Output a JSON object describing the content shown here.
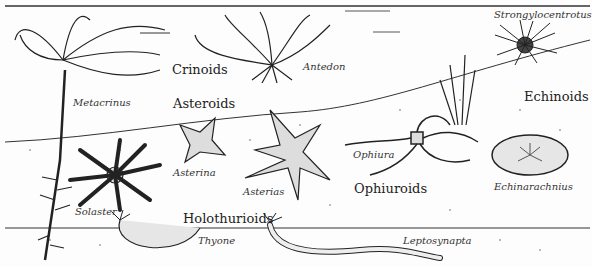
{
  "illustration": {
    "subject": "Echinoderm classes in marine habitat",
    "groups": [
      {
        "id": "crinoids",
        "label": "Crinoids",
        "x": 172,
        "y": 63
      },
      {
        "id": "asteroids",
        "label": "Asteroids",
        "x": 173,
        "y": 97
      },
      {
        "id": "echinoids",
        "label": "Echinoids",
        "x": 524,
        "y": 90
      },
      {
        "id": "ophiuroids",
        "label": "Ophiuroids",
        "x": 354,
        "y": 182
      },
      {
        "id": "holothurioids",
        "label": "Holothurioids",
        "x": 183,
        "y": 212
      }
    ],
    "genera": [
      {
        "id": "strongylocentrotus",
        "label": "Strongylocentrotus",
        "x": 494,
        "y": 10
      },
      {
        "id": "antedon",
        "label": "Antedon",
        "x": 303,
        "y": 62
      },
      {
        "id": "metacrinus",
        "label": "Metacrinus",
        "x": 73,
        "y": 98
      },
      {
        "id": "asterina",
        "label": "Asterina",
        "x": 173,
        "y": 168
      },
      {
        "id": "asterias",
        "label": "Asterias",
        "x": 243,
        "y": 187
      },
      {
        "id": "ophiura",
        "label": "Ophiura",
        "x": 353,
        "y": 150
      },
      {
        "id": "echinarachnius",
        "label": "Echinarachnius",
        "x": 494,
        "y": 182
      },
      {
        "id": "solaster",
        "label": "Solaster",
        "x": 75,
        "y": 207
      },
      {
        "id": "thyone",
        "label": "Thyone",
        "x": 198,
        "y": 236
      },
      {
        "id": "leptosynapta",
        "label": "Leptosynapta",
        "x": 403,
        "y": 236
      }
    ]
  }
}
